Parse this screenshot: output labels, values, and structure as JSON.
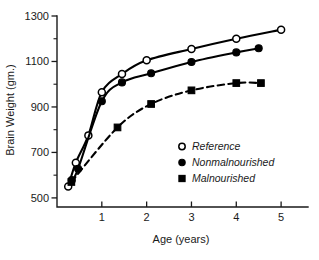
{
  "chart_data": {
    "type": "line",
    "title": "",
    "xlabel": "Age (years)",
    "ylabel": "Brain Weight (gm.)",
    "xlim": [
      0,
      5.6
    ],
    "ylim": [
      460,
      1300
    ],
    "grid": false,
    "legend_position": "center-right-inside",
    "x_ticks": [
      1,
      2,
      3,
      4,
      5
    ],
    "x_tick_labels": [
      "1",
      "2",
      "3",
      "4",
      "5"
    ],
    "y_ticks": [
      500,
      700,
      900,
      1100,
      1300
    ],
    "y_tick_labels": [
      "500",
      "700",
      "900",
      "1100",
      "1300"
    ],
    "y_minor_ticks": [
      600,
      800,
      1000,
      1200
    ],
    "series": [
      {
        "name": "Reference",
        "marker": "open-circle",
        "line_style": "solid",
        "color": "#000000",
        "x": [
          0.25,
          0.42,
          0.7,
          1.0,
          1.45,
          2.0,
          3.0,
          4.0,
          5.0
        ],
        "values": [
          550,
          655,
          775,
          965,
          1045,
          1105,
          1155,
          1200,
          1240
        ]
      },
      {
        "name": "Nonmalnourished",
        "marker": "filled-circle",
        "line_style": "solid",
        "color": "#000000",
        "x": [
          0.33,
          0.47,
          1.0,
          1.45,
          2.1,
          3.0,
          4.0,
          4.5
        ],
        "values": [
          578,
          628,
          925,
          1008,
          1048,
          1098,
          1140,
          1158
        ]
      },
      {
        "name": "Malnourished",
        "marker": "filled-square",
        "line_style": "dashed",
        "color": "#000000",
        "x": [
          0.32,
          1.35,
          2.1,
          3.0,
          4.0,
          4.55
        ],
        "values": [
          570,
          810,
          913,
          973,
          1005,
          1005
        ]
      }
    ]
  },
  "legend": {
    "entries": [
      {
        "label": "Reference",
        "marker": "open-circle"
      },
      {
        "label": "Nonmalnourished",
        "marker": "filled-circle"
      },
      {
        "label": "Malnourished",
        "marker": "filled-square"
      }
    ]
  }
}
